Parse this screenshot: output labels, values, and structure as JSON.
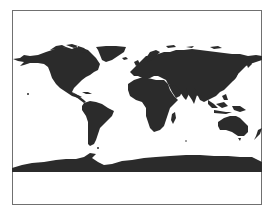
{
  "map": {
    "projection": "equirectangular",
    "land_color": "#2b2b2b",
    "ocean_color": "#ffffff",
    "frame_color": "#707070",
    "regions": [
      "North America",
      "Greenland",
      "South America",
      "Europe",
      "Africa",
      "Madagascar",
      "Asia",
      "Japan",
      "Maritime Southeast Asia",
      "New Guinea",
      "Australia",
      "New Zealand",
      "Antarctica"
    ]
  }
}
